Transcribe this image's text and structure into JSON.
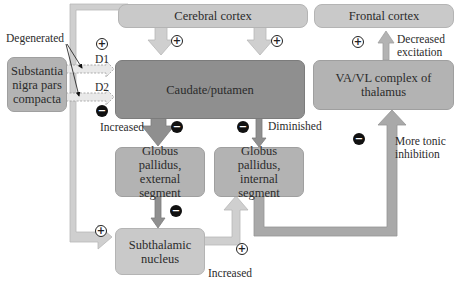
{
  "nodes": {
    "cerebral_cortex": "Cerebral cortex",
    "frontal_cortex": "Frontal cortex",
    "substantia_nigra": "Substantia nigra pars compacta",
    "caudate_putamen": "Caudate/putamen",
    "vavl_thalamus": "VA/VL complex of thalamus",
    "gp_external": "Globus pallidus, external segment",
    "gp_internal": "Globus pallidus, internal segment",
    "subthalamic": "Subthalamic nucleus"
  },
  "labels": {
    "degenerated": "Degenerated",
    "d1": "D1",
    "d2": "D2",
    "increased_striatum": "Increased",
    "diminished": "Diminished",
    "decreased_excitation_1": "Decreased",
    "decreased_excitation_2": "excitation",
    "more_tonic_1": "More tonic",
    "more_tonic_2": "inhibition",
    "increased_stn": "Increased"
  },
  "signs": {
    "plus": "+",
    "minus": "−"
  },
  "colors": {
    "light_box": "#c9c9c9",
    "mid_box": "#b3b3b3",
    "dark_box": "#8f8f8f",
    "light_arrow": "#cfcfcf",
    "dark_arrow": "#8f8f8f"
  }
}
